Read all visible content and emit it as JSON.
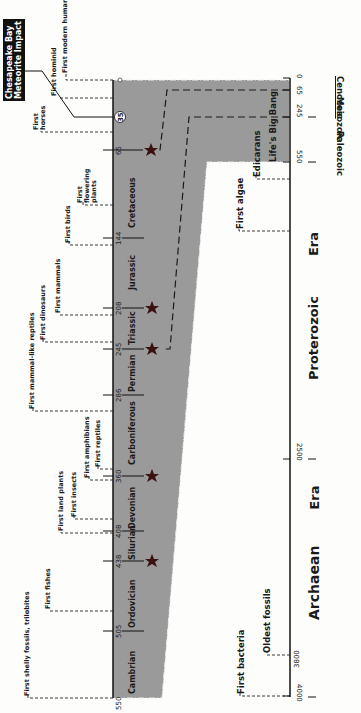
{
  "title_box": {
    "line1": "Chesapeake Bay",
    "line2": "Meteorite Impact"
  },
  "impact_marker": "35",
  "periods": [
    {
      "name": "Cretaceous",
      "start": 144,
      "end": 65
    },
    {
      "name": "Jurassic",
      "start": 208,
      "end": 144
    },
    {
      "name": "Triassic",
      "start": 245,
      "end": 208
    },
    {
      "name": "Permian",
      "start": 286,
      "end": 245
    },
    {
      "name": "Carboniferous",
      "start": 360,
      "end": 286
    },
    {
      "name": "Devonian",
      "start": 408,
      "end": 360
    },
    {
      "name": "Silurian",
      "start": 438,
      "end": 408
    },
    {
      "name": "Ordovician",
      "start": 505,
      "end": 438
    },
    {
      "name": "Cambrian",
      "start": 550,
      "end": 505
    }
  ],
  "period_ticks": [
    "0",
    "65",
    "144",
    "208",
    "245",
    "286",
    "360",
    "408",
    "438",
    "505",
    "550"
  ],
  "mass_extinctions_at": [
    65,
    208,
    245,
    360,
    438
  ],
  "life_events": [
    {
      "label": "First modern human"
    },
    {
      "label": "First hominid"
    },
    {
      "label": "First horses"
    },
    {
      "label": "First flowering plants"
    },
    {
      "label": "First birds"
    },
    {
      "label": "First mammals"
    },
    {
      "label": "First dinosaurs"
    },
    {
      "label": "First mammal-like reptiles"
    },
    {
      "label": "First reptiles"
    },
    {
      "label": "First amphibians"
    },
    {
      "label": "First insects"
    },
    {
      "label": "First land plants"
    },
    {
      "label": "First fishes"
    },
    {
      "label": "First shelly fossils, trilobites"
    }
  ],
  "precambrian_events": [
    {
      "label": "Life's Big Bang"
    },
    {
      "label": "Edicarans"
    },
    {
      "label": "First algae"
    },
    {
      "label": "Oldest fossils"
    },
    {
      "label": "First bacteria"
    }
  ],
  "era_axis": {
    "ticks": [
      "0",
      "65",
      "245",
      "550",
      "2500",
      "3800",
      "4000"
    ],
    "eras": [
      "Cenozoic",
      "Mesozoic",
      "Paleozoic"
    ],
    "eons": [
      {
        "name": "Proterozoic",
        "suffix": "Era"
      },
      {
        "name": "Archaean",
        "suffix": "Era"
      }
    ]
  },
  "colors": {
    "band": "#9a9a9a",
    "ink": "#1a1a1a",
    "star": "#3a1010",
    "background": "#fdfdfb"
  }
}
